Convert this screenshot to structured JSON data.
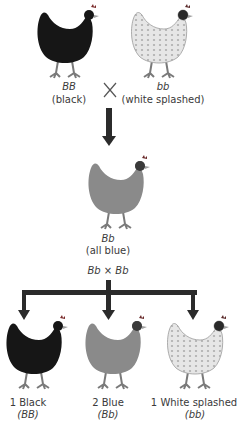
{
  "parents": {
    "left": {
      "genotype": "BB",
      "phenotype": "(black)",
      "color": "#161616"
    },
    "right": {
      "genotype": "bb",
      "phenotype": "(white splashed)",
      "color": "#e2e2e2"
    },
    "cross_symbol": "×"
  },
  "f1": {
    "genotype": "Bb",
    "phenotype": "(all blue)",
    "color": "#8a8a8a"
  },
  "f1_cross": {
    "label": "Bb × Bb"
  },
  "f2": [
    {
      "ratio_label": "1 Black",
      "genotype": "(BB)",
      "color": "#161616"
    },
    {
      "ratio_label": "2 Blue",
      "genotype": "(Bb)",
      "color": "#8a8a8a"
    },
    {
      "ratio_label": "1 White splashed",
      "genotype": "(bb)",
      "color": "#e2e2e2"
    }
  ],
  "arrow_color": "#2b2b2b"
}
